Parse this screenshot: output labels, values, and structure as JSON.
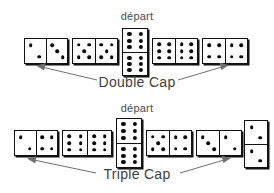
{
  "figure": {
    "type": "domino-diagram",
    "background": "#ffffff",
    "ink": "#111111",
    "arrow_color": "#6f6f6f",
    "text_color": "#444444"
  },
  "rows": [
    {
      "id": "double-cap-row",
      "start_label": "départ",
      "cap_label": "Double Cap",
      "dominoes": [
        {
          "name": "domino-1",
          "orientation": "horizontal",
          "left": 2,
          "right": 3,
          "is_start": false
        },
        {
          "name": "domino-2",
          "orientation": "horizontal",
          "left": 5,
          "right": 5,
          "is_start": false
        },
        {
          "name": "domino-start",
          "orientation": "vertical",
          "left": 6,
          "right": 6,
          "is_start": true
        },
        {
          "name": "domino-4",
          "orientation": "horizontal",
          "left": 6,
          "right": 6,
          "is_start": false
        },
        {
          "name": "domino-5",
          "orientation": "horizontal",
          "left": 4,
          "right": 4,
          "is_start": false
        }
      ],
      "arrow_targets": [
        "domino-1",
        "domino-5"
      ]
    },
    {
      "id": "triple-cap-row",
      "start_label": "départ",
      "cap_label": "Triple Cap",
      "dominoes": [
        {
          "name": "domino-1",
          "orientation": "horizontal",
          "left": 2,
          "right": 4,
          "is_start": false
        },
        {
          "name": "domino-2",
          "orientation": "horizontal",
          "left": 6,
          "right": 6,
          "is_start": false
        },
        {
          "name": "domino-start",
          "orientation": "vertical",
          "left": 6,
          "right": 6,
          "is_start": true
        },
        {
          "name": "domino-4",
          "orientation": "horizontal",
          "left": 5,
          "right": 4,
          "is_start": false
        },
        {
          "name": "domino-5",
          "orientation": "horizontal",
          "left": 3,
          "right": 2,
          "is_start": false
        },
        {
          "name": "domino-6",
          "orientation": "vertical",
          "left": 2,
          "right": 2,
          "is_start": false
        }
      ],
      "arrow_targets": [
        "domino-1",
        "domino-6"
      ]
    }
  ]
}
